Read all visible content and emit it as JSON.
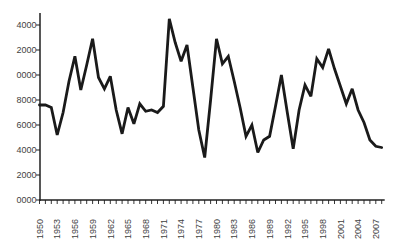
{
  "chart_data": {
    "type": "line",
    "title": "",
    "xlabel": "",
    "ylabel": "",
    "x": [
      1950,
      1951,
      1952,
      1953,
      1954,
      1955,
      1956,
      1957,
      1958,
      1959,
      1960,
      1961,
      1962,
      1963,
      1964,
      1965,
      1966,
      1967,
      1968,
      1969,
      1970,
      1971,
      1972,
      1973,
      1974,
      1975,
      1976,
      1977,
      1978,
      1979,
      1980,
      1981,
      1982,
      1983,
      1984,
      1985,
      1986,
      1987,
      1988,
      1989,
      1990,
      1991,
      1992,
      1993,
      1994,
      1995,
      1996,
      1997,
      1998,
      1999,
      2000,
      2001,
      2002,
      2003,
      2004,
      2005,
      2006,
      2007,
      2008
    ],
    "values": [
      7600,
      7600,
      7400,
      5200,
      7000,
      9500,
      11500,
      8800,
      10800,
      12900,
      9800,
      8900,
      9900,
      7200,
      5300,
      7400,
      6100,
      7700,
      7100,
      7200,
      7000,
      7500,
      14500,
      12600,
      11100,
      12400,
      9000,
      5600,
      3400,
      8000,
      12900,
      10900,
      11500,
      9500,
      7400,
      5100,
      6000,
      3800,
      4800,
      5100,
      7500,
      10000,
      7000,
      4100,
      7200,
      9200,
      8300,
      11300,
      10600,
      12100,
      10500,
      9100,
      7700,
      8900,
      7200,
      6200,
      4800,
      4300,
      4200
    ],
    "x_axis": {
      "tick_label_years": [
        1950,
        1953,
        1956,
        1959,
        1962,
        1965,
        1968,
        1971,
        1974,
        1977,
        1980,
        1983,
        1986,
        1989,
        1992,
        1995,
        1998,
        2001,
        2004,
        2007
      ],
      "minor_tick_every_years": 1,
      "labels_rotated": true
    },
    "y_axis": {
      "min": 0,
      "max": 14000,
      "tick_step": 2000,
      "tick_values": [
        0,
        2000,
        4000,
        6000,
        8000,
        10000,
        12000,
        14000
      ],
      "tick_labels_as_displayed_bottom_to_top": [
        "0000",
        "2000",
        "4000",
        "6000",
        "8000",
        "0000",
        "2000",
        "4000"
      ]
    },
    "legend": null,
    "grid": false,
    "series_color": "#1a1a1a",
    "axis_color": "#1f1f1f",
    "label_color": "#3f3f3f",
    "background_color": "#ffffff"
  }
}
